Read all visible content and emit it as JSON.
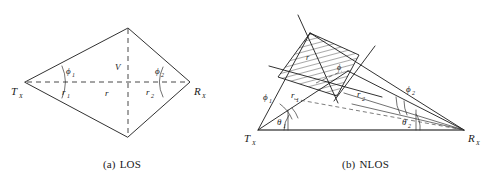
{
  "figure": {
    "background_color": "#ffffff",
    "line_color": "#1a1a1a",
    "dash_color": "#333333",
    "baseline_color": "#555555"
  },
  "panels": [
    {
      "id": "los",
      "caption_tag": "(a)",
      "caption_text": "LOS",
      "nodes": {
        "tx": "T",
        "tx_sub": "X",
        "rx": "R",
        "rx_sub": "X"
      },
      "labels": {
        "phi1": "ϕ",
        "phi1_sub": "1",
        "phi2": "ϕ",
        "phi2_sub": "2",
        "r1": "r",
        "r1_sub": "1",
        "r2": "r",
        "r2_sub": "2",
        "r": "r",
        "v": "V"
      }
    },
    {
      "id": "nlos",
      "caption_tag": "(b)",
      "caption_text": "NLOS",
      "nodes": {
        "tx": "T",
        "tx_sub": "X",
        "rx": "R",
        "rx_sub": "X"
      },
      "labels": {
        "phi1": "ϕ",
        "phi1_sub": "1",
        "phi2": "ϕ",
        "phi2_sub": "2",
        "theta1": "θ",
        "theta1_sub": "1",
        "theta2": "θ",
        "theta2_sub": "2",
        "r1": "r",
        "r1_sub": "1",
        "r2": "r",
        "r2_sub": "2",
        "region_r": "r",
        "region_phi": "ϕ"
      }
    }
  ]
}
